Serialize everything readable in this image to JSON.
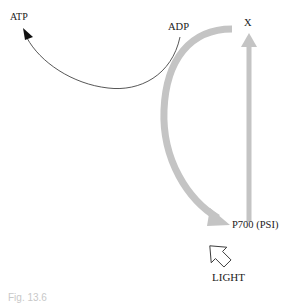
{
  "diagram": {
    "nodes": [
      {
        "id": "atp",
        "label": "ATP"
      },
      {
        "id": "adp",
        "label": "ADP"
      },
      {
        "id": "x",
        "label": "X"
      },
      {
        "id": "p700",
        "label": "P700 (PSI)"
      },
      {
        "id": "light",
        "label": "LIGHT"
      }
    ],
    "edges": [
      {
        "from": "adp",
        "to": "atp",
        "style": "thin-curve"
      },
      {
        "from": "p700",
        "to": "x",
        "style": "thick-gray-straight"
      },
      {
        "from": "x",
        "to": "p700",
        "style": "thick-gray-curve"
      },
      {
        "from": "light",
        "to": "p700",
        "style": "outline-arrow"
      }
    ],
    "colors": {
      "thick_arrow": "#c4c4c4",
      "thin_line": "#333333",
      "text": "#1a1a1a"
    },
    "caption": "Fig. 13.6"
  }
}
